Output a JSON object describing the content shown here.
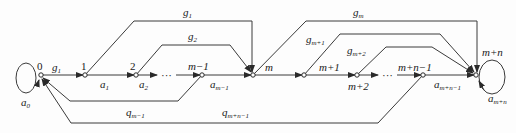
{
  "diagram": {
    "type": "signal-flow-graph",
    "nodes": [
      {
        "id": "0",
        "label": "0",
        "x": 41,
        "y": 75
      },
      {
        "id": "1",
        "label": "1",
        "x": 85,
        "y": 75
      },
      {
        "id": "2",
        "label": "2",
        "x": 136,
        "y": 75
      },
      {
        "id": "m-1",
        "label": "m−1",
        "x": 202,
        "y": 75
      },
      {
        "id": "m",
        "label": "m",
        "x": 253,
        "y": 75
      },
      {
        "id": "m+1",
        "label": "m+1",
        "x": 304,
        "y": 75
      },
      {
        "id": "m+2",
        "label": "m+2",
        "x": 357,
        "y": 75
      },
      {
        "id": "m+n-1",
        "label": "m+n−1",
        "x": 423,
        "y": 75
      },
      {
        "id": "m+n",
        "label": "m+n",
        "x": 476,
        "y": 75
      }
    ],
    "labels": {
      "node_0": "0",
      "node_1": "1",
      "node_2": "2",
      "node_m_minus_1": "m−1",
      "node_m": "m",
      "node_m_plus_1": "m+1",
      "node_m_plus_2": "m+2",
      "node_m_plus_n_minus_1": "m+n−1",
      "node_m_plus_n": "m+n",
      "ellipsis": "···"
    },
    "edges": {
      "g1_main": {
        "base": "g",
        "sub": "1"
      },
      "g1_top": {
        "base": "g",
        "sub": "1"
      },
      "g2": {
        "base": "g",
        "sub": "2"
      },
      "gm": {
        "base": "g",
        "sub": "m"
      },
      "gm1": {
        "base": "g",
        "sub": "m+1"
      },
      "gm2": {
        "base": "g",
        "sub": "m+2"
      },
      "a0": {
        "base": "a",
        "sub": "0"
      },
      "a1": {
        "base": "a",
        "sub": "1"
      },
      "a2": {
        "base": "a",
        "sub": "2"
      },
      "am1": {
        "base": "a",
        "sub": "m−1"
      },
      "amn1": {
        "base": "a",
        "sub": "m+n−1"
      },
      "amn": {
        "base": "a",
        "sub": "m+n"
      },
      "qm1": {
        "base": "q",
        "sub": "m−1"
      },
      "qmn1": {
        "base": "q",
        "sub": "m+n−1"
      }
    },
    "colors": {
      "line": "#3a3a3a",
      "background": "#fdfdfd",
      "text": "#1a1a1a"
    }
  }
}
